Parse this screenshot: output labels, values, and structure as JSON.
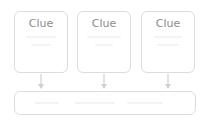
{
  "diagram": {
    "clues": [
      {
        "label": "Clue"
      },
      {
        "label": "Clue"
      },
      {
        "label": "Clue"
      }
    ],
    "result_box": {
      "label": ""
    },
    "colors": {
      "border": "#dcdcdc",
      "text": "#8c8c8c",
      "arrow": "#cfcfcf",
      "background": "#ffffff"
    }
  }
}
